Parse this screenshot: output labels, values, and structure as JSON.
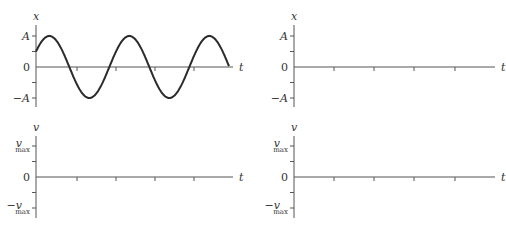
{
  "chart_data": [
    {
      "id": "top-left",
      "type": "line",
      "title": "",
      "xlabel": "t",
      "ylabel": "x",
      "y_tick_labels": [
        "A",
        "0",
        "-A"
      ],
      "grid": false,
      "description": "Sinusoidal position vs time: x(t) = A sin(2*pi*t/T + pi/6), starting at 0.5A rising, ~2.4 periods shown, ending at 0",
      "series": [
        {
          "name": "x(t)",
          "amplitude": 1,
          "initial_value": 0.5,
          "phase_deg": 30,
          "periods_shown": 2.41,
          "x": [
            0,
            0.33,
            1,
            2,
            3,
            4,
            5
          ],
          "values": [
            0.5,
            1,
            -0.87,
            0.5,
            -0.5,
            0.87,
            -0.1
          ]
        }
      ],
      "x_ticks": 4,
      "ylim": [
        -1,
        1
      ]
    },
    {
      "id": "top-right",
      "type": "line",
      "title": "",
      "xlabel": "t",
      "ylabel": "x",
      "y_tick_labels": [
        "A",
        "0",
        "-A"
      ],
      "grid": false,
      "series": [],
      "x_ticks": 4,
      "ylim": [
        -1,
        1
      ]
    },
    {
      "id": "bottom-left",
      "type": "line",
      "title": "",
      "xlabel": "t",
      "ylabel": "v",
      "y_tick_labels": [
        "v_max",
        "0",
        "-v_max"
      ],
      "grid": false,
      "series": [],
      "x_ticks": 4,
      "ylim": [
        -1,
        1
      ]
    },
    {
      "id": "bottom-right",
      "type": "line",
      "title": "",
      "xlabel": "t",
      "ylabel": "v",
      "y_tick_labels": [
        "v_max",
        "0",
        "-v_max"
      ],
      "grid": false,
      "series": [],
      "x_ticks": 4,
      "ylim": [
        -1,
        1
      ]
    }
  ],
  "panels": [
    {
      "name": "position-plot-given",
      "ylabel": "x",
      "xlabel": "t",
      "ticks": {
        "top": "A",
        "zero": "0",
        "bottom": "−A",
        "top_sub": "",
        "bottom_sub": ""
      },
      "origin": {
        "x": 36,
        "y": 67
      },
      "unit": 31,
      "axis_end_x": 233,
      "axis_top_y": 25,
      "axis_bottom_y": 107,
      "x_ticks_px": [
        77,
        116,
        155,
        194
      ],
      "curve": {
        "amplitude_px": 31,
        "period_px": 80,
        "phase_deg": 30,
        "end_x": 229
      }
    },
    {
      "name": "position-plot-blank",
      "ylabel": "x",
      "xlabel": "t",
      "ticks": {
        "top": "A",
        "zero": "0",
        "bottom": "−A",
        "top_sub": "",
        "bottom_sub": ""
      },
      "origin": {
        "x": 294,
        "y": 67
      },
      "unit": 31,
      "axis_end_x": 495,
      "axis_top_y": 25,
      "axis_bottom_y": 107,
      "x_ticks_px": [
        334,
        374,
        414,
        455
      ],
      "curve": null
    },
    {
      "name": "velocity-plot-left",
      "ylabel": "v",
      "xlabel": "t",
      "ticks": {
        "top": "v",
        "zero": "0",
        "bottom": "−v",
        "top_sub": "max",
        "bottom_sub": "max"
      },
      "origin": {
        "x": 36,
        "y": 177
      },
      "unit": 31,
      "axis_end_x": 233,
      "axis_top_y": 136,
      "axis_bottom_y": 218,
      "x_ticks_px": [
        77,
        116,
        155,
        194
      ],
      "curve": null
    },
    {
      "name": "velocity-plot-right",
      "ylabel": "v",
      "xlabel": "t",
      "ticks": {
        "top": "v",
        "zero": "0",
        "bottom": "−v",
        "top_sub": "max",
        "bottom_sub": "max"
      },
      "origin": {
        "x": 294,
        "y": 177
      },
      "unit": 31,
      "axis_end_x": 495,
      "axis_top_y": 136,
      "axis_bottom_y": 218,
      "x_ticks_px": [
        334,
        374,
        414,
        455
      ],
      "curve": null
    }
  ]
}
